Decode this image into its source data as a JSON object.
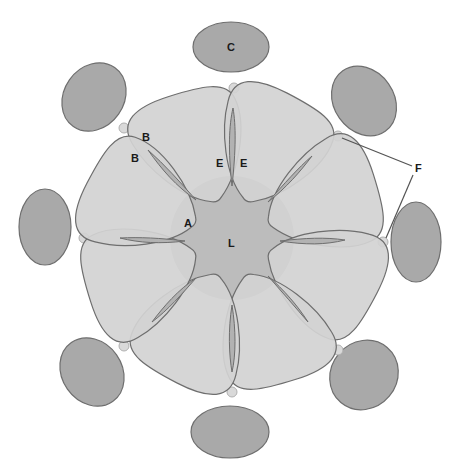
{
  "diagram": {
    "type": "cross-section schematic",
    "center": [
      232,
      236
    ],
    "colors": {
      "background": "#ffffff",
      "outer_ellipse_fill": "#a9a9a9",
      "petal_fill": "#d2d2d2",
      "lumen_fill": "#bcbcbc",
      "overlap_fill": "#b2b2b2",
      "outline": "#6e6e6e",
      "small_circle_fill": "#d9d9d9",
      "small_circle_stroke": "#b0b0b0",
      "leader_line": "#555555",
      "label_text": "#1a1a1a"
    },
    "labels": {
      "A": "A",
      "B1": "B",
      "B2": "B",
      "C": "C",
      "E1": "E",
      "E2": "E",
      "F": "F",
      "L": "L"
    },
    "components": {
      "petals_count": 8,
      "outer_ellipses_count": 8,
      "small_circles_count": 8,
      "central_region_label": "L",
      "outer_ellipse_labeled": "C"
    }
  }
}
